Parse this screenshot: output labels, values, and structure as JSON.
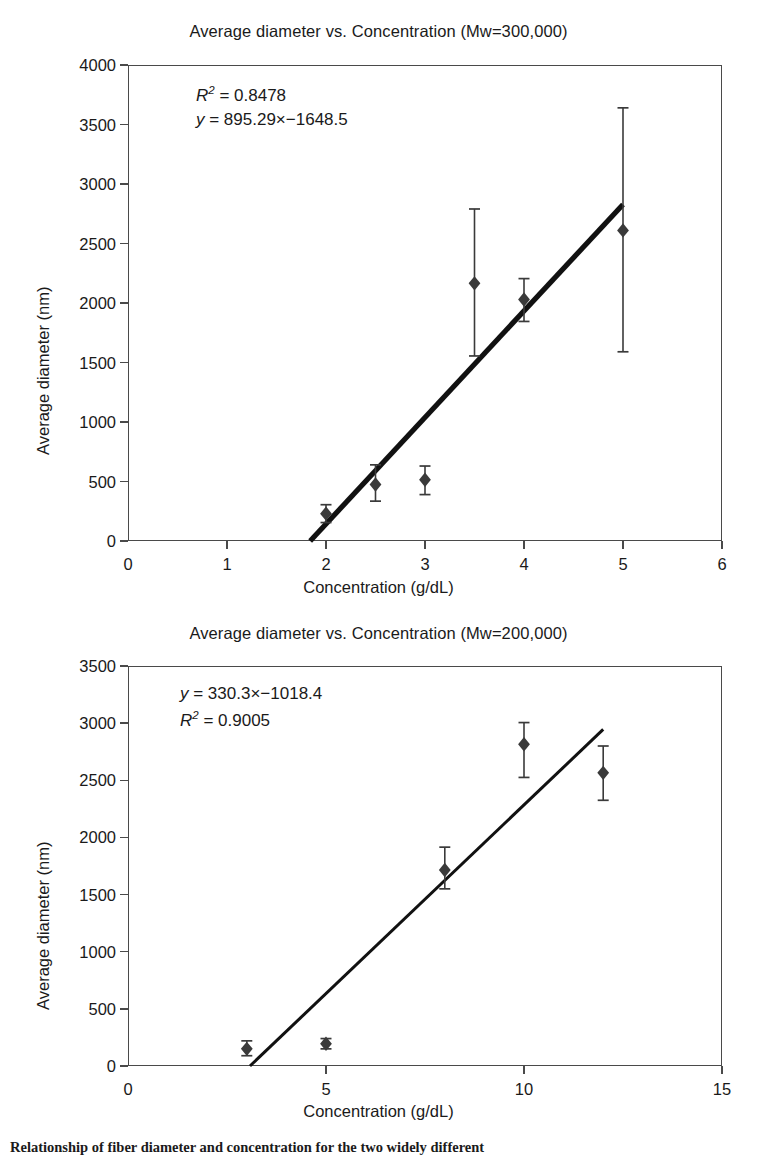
{
  "figure": {
    "caption": "Relationship of fiber diameter and concentration for the two widely different"
  },
  "charts": [
    {
      "id": "chart-mw300000",
      "title": "Average diameter vs. Concentration (Mw=300,000)",
      "annotation": {
        "line1_prefix": "R",
        "line1_sup": "2",
        "line1_rest": " = 0.8478",
        "line2_prefix": "y",
        "line2_rest": " = 895.29×−1648.5"
      },
      "axes": {
        "xlabel_prefix": "Concentration (",
        "xlabel_italic1": "g",
        "xlabel_mid": "/d",
        "xlabel_italic2": "L",
        "xlabel_suffix": ")",
        "ylabel": "Average diameter (nm)",
        "xticks": [
          "0",
          "1",
          "2",
          "3",
          "4",
          "5",
          "6"
        ],
        "yticks": [
          "0",
          "500",
          "1000",
          "1500",
          "2000",
          "2500",
          "3000",
          "3500",
          "4000"
        ]
      }
    },
    {
      "id": "chart-mw200000",
      "title": "Average diameter vs. Concentration (Mw=200,000)",
      "annotation": {
        "line1_prefix": "y",
        "line1_rest": " = 330.3×−1018.4",
        "line2_prefix": "R",
        "line2_sup": "2",
        "line2_rest": " = 0.9005"
      },
      "axes": {
        "xlabel_prefix": "Concentration (",
        "xlabel_italic1": "g",
        "xlabel_mid": "/d",
        "xlabel_italic2": "L",
        "xlabel_suffix": ")",
        "ylabel": "Average diameter (nm)",
        "xticks": [
          "0",
          "5",
          "10",
          "15"
        ],
        "yticks": [
          "0",
          "500",
          "1000",
          "1500",
          "2000",
          "2500",
          "3000",
          "3500"
        ]
      }
    }
  ],
  "chart_data": [
    {
      "type": "scatter",
      "title": "Average diameter vs. Concentration (Mw=300,000)",
      "xlabel": "Concentration (g/dL)",
      "ylabel": "Average diameter (nm)",
      "xlim": [
        0,
        6
      ],
      "ylim": [
        0,
        4000
      ],
      "xticks": [
        0,
        1,
        2,
        3,
        4,
        5,
        6
      ],
      "yticks": [
        0,
        500,
        1000,
        1500,
        2000,
        2500,
        3000,
        3500,
        4000
      ],
      "grid": false,
      "legend": "none",
      "marker": "filled-diamond",
      "marker_color": "#3a3a3a",
      "x": [
        2.0,
        2.5,
        3.0,
        3.5,
        4.0,
        5.0
      ],
      "y": [
        230,
        475,
        515,
        2165,
        2030,
        2610
      ],
      "yerr_lower": [
        75,
        140,
        125,
        610,
        185,
        1020
      ],
      "yerr_upper": [
        75,
        165,
        115,
        625,
        175,
        1030
      ],
      "trendline": {
        "equation": "y = 895.29x - 1648.5",
        "slope": 895.29,
        "intercept": -1648.5,
        "r_squared": 0.8478,
        "x_start": 1.84,
        "x_end": 5.0,
        "y_start": 0,
        "y_end": 2828
      },
      "annotations": [
        "R² = 0.8478",
        "y = 895.29×−1648.5"
      ]
    },
    {
      "type": "scatter",
      "title": "Average diameter vs. Concentration (Mw=200,000)",
      "xlabel": "Concentration (g/dL)",
      "ylabel": "Average diameter (nm)",
      "xlim": [
        0,
        15
      ],
      "ylim": [
        0,
        3500
      ],
      "xticks": [
        0,
        5,
        10,
        15
      ],
      "yticks": [
        0,
        500,
        1000,
        1500,
        2000,
        2500,
        3000,
        3500
      ],
      "grid": false,
      "legend": "none",
      "marker": "filled-diamond",
      "marker_color": "#3a3a3a",
      "x": [
        3.0,
        5.0,
        8.0,
        10.0,
        12.0
      ],
      "y": [
        150,
        195,
        1715,
        2815,
        2565
      ],
      "yerr_lower": [
        60,
        45,
        165,
        290,
        240
      ],
      "yerr_upper": [
        70,
        45,
        200,
        190,
        235
      ],
      "trendline": {
        "equation": "y = 330.3x - 1018.4",
        "slope": 330.3,
        "intercept": -1018.4,
        "r_squared": 0.9005,
        "x_start": 3.08,
        "x_end": 12.0,
        "y_start": 0,
        "y_end": 2945
      },
      "annotations": [
        "y = 330.3×−1018.4",
        "R² = 0.9005"
      ]
    }
  ]
}
